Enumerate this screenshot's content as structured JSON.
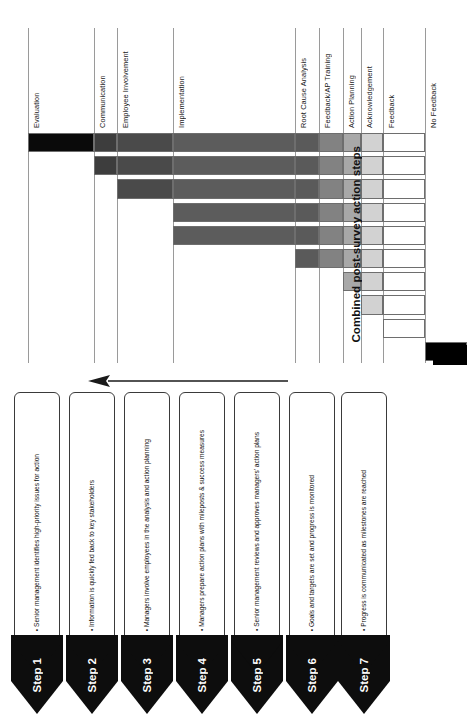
{
  "chart_data": {
    "type": "bar",
    "orientation": "stacked-horizontal-rotated",
    "title": "Combined post-survey action steps",
    "xlabel": "",
    "ylabel": "",
    "grid": true,
    "legend_position": "axis-labels",
    "categories": [
      "Evaluation",
      "Communication",
      "Employee Involvement",
      "Implementation",
      "Root Cause Analysis",
      "Feedback/AP Training",
      "Action Planning",
      "Acknowledgement",
      "Feedback",
      "No Feedback"
    ],
    "category_colors": [
      "#0a0a0a",
      "#3d3d3d",
      "#4a4a4a",
      "#5c5c5c",
      "#5a5a5a",
      "#828282",
      "#a8a8a8",
      "#d2d2d2",
      "#ffffff",
      "#000000"
    ],
    "series": [
      {
        "name": "Bar 1",
        "segments": [
          "Evaluation",
          "Communication",
          "Employee Involvement",
          "Implementation",
          "Root Cause Analysis",
          "Feedback/AP Training",
          "Action Planning",
          "Acknowledgement",
          "Feedback"
        ]
      },
      {
        "name": "Bar 2",
        "segments": [
          "Communication",
          "Employee Involvement",
          "Implementation",
          "Root Cause Analysis",
          "Feedback/AP Training",
          "Action Planning",
          "Acknowledgement",
          "Feedback"
        ]
      },
      {
        "name": "Bar 3",
        "segments": [
          "Employee Involvement",
          "Implementation",
          "Root Cause Analysis",
          "Feedback/AP Training",
          "Action Planning",
          "Acknowledgement",
          "Feedback"
        ]
      },
      {
        "name": "Bar 4",
        "segments": [
          "Implementation",
          "Root Cause Analysis",
          "Feedback/AP Training",
          "Action Planning",
          "Acknowledgement",
          "Feedback"
        ]
      },
      {
        "name": "Bar 5",
        "segments": [
          "Implementation",
          "Root Cause Analysis",
          "Feedback/AP Training",
          "Action Planning",
          "Acknowledgement",
          "Feedback"
        ]
      },
      {
        "name": "Bar 6",
        "segments": [
          "Root Cause Analysis",
          "Feedback/AP Training",
          "Action Planning",
          "Acknowledgement",
          "Feedback"
        ]
      },
      {
        "name": "Bar 7",
        "segments": [
          "Action Planning",
          "Acknowledgement",
          "Feedback"
        ]
      },
      {
        "name": "Bar 8",
        "segments": [
          "Acknowledgement",
          "Feedback"
        ]
      },
      {
        "name": "Bar 9",
        "segments": [
          "Feedback"
        ]
      },
      {
        "name": "Bar 10",
        "segments": [
          "No Feedback"
        ]
      }
    ]
  },
  "chart": {
    "caption": "Combined post-survey action steps",
    "column_labels": [
      "Evaluation",
      "Communication",
      "Employee Involvement",
      "Implementation",
      "Root Cause Analysis",
      "Feedback/AP Training",
      "Action Planning",
      "Acknowledgement",
      "Feedback",
      "No Feedback"
    ]
  },
  "arrow": {
    "name": "process-direction-arrow",
    "direction": "left"
  },
  "steps": {
    "items": [
      {
        "number": "Step 1",
        "text": "Senior management identifies high-priority issues for action"
      },
      {
        "number": "Step 2",
        "text": "Information is quickly fed back to key stakeholders"
      },
      {
        "number": "Step 3",
        "text": "Managers involve employees in the analysis and action planning"
      },
      {
        "number": "Step 4",
        "text": "Managers prepare action plans with mileposts & success measures"
      },
      {
        "number": "Step 5",
        "text": "Senior management reviews and approves managers' action plans"
      },
      {
        "number": "Step 6",
        "text": "Goals and targets are set and progress is monitored"
      },
      {
        "number": "Step 7",
        "text": "Progress is communicated as milestones are reached"
      }
    ]
  }
}
